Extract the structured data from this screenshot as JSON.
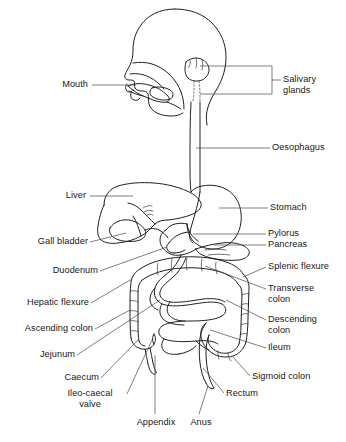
{
  "diagram": {
    "background_color": "#ffffff",
    "line_color": "#231f20",
    "text_color": "#1a1718",
    "labels": {
      "mouth": "Mouth",
      "salivary_glands": "Salivary glands",
      "oesophagus": "Oesophagus",
      "liver": "Liver",
      "stomach": "Stomach",
      "gall_bladder": "Gall bladder",
      "pylorus": "Pylorus",
      "pancreas": "Pancreas",
      "duodenum": "Duodenum",
      "splenic_flexure": "Splenic flexure",
      "hepatic_flexure": "Hepatic flexure",
      "transverse_colon": "Transverse\ncolon",
      "ascending_colon": "Ascending colon",
      "descending_colon": "Descending\ncolon",
      "jejunum": "Jejunum",
      "ileum": "Ileum",
      "caecum": "Caecum",
      "sigmoid_colon": "Sigmoid colon",
      "ileo_caecal_valve": "Ileo-caecal\nvalve",
      "rectum": "Rectum",
      "appendix": "Appendix",
      "anus": "Anus"
    }
  }
}
